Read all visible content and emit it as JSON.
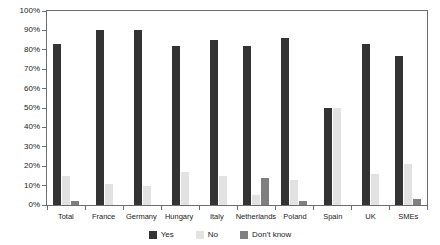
{
  "chart_data": {
    "type": "bar",
    "title": "",
    "subtitle": "",
    "xlabel": "",
    "ylabel": "",
    "ylim": [
      0,
      100
    ],
    "y_ticks": [
      "0%",
      "10%",
      "20%",
      "30%",
      "40%",
      "50%",
      "60%",
      "70%",
      "80%",
      "90%",
      "100%"
    ],
    "y_tick_values": [
      0,
      10,
      20,
      30,
      40,
      50,
      60,
      70,
      80,
      90,
      100
    ],
    "grid": false,
    "legend_position": "bottom",
    "categories": [
      "Total",
      "France",
      "Germany",
      "Hungary",
      "Italy",
      "Netherlands",
      "Poland",
      "Spain",
      "UK",
      "SMEs"
    ],
    "series": [
      {
        "name": "Yes",
        "color": "#333333",
        "values": [
          83,
          90,
          90,
          82,
          85,
          82,
          86,
          50,
          83,
          77
        ]
      },
      {
        "name": "No",
        "color": "#e2e2e2",
        "values": [
          15,
          11,
          10,
          17,
          15,
          5,
          13,
          50,
          16,
          21
        ]
      },
      {
        "name": "Don't know",
        "color": "#808080",
        "values": [
          2,
          0,
          0,
          0,
          0,
          14,
          2,
          0,
          0,
          3
        ]
      }
    ]
  },
  "axis": {
    "line_color": "#6d6d6d"
  }
}
